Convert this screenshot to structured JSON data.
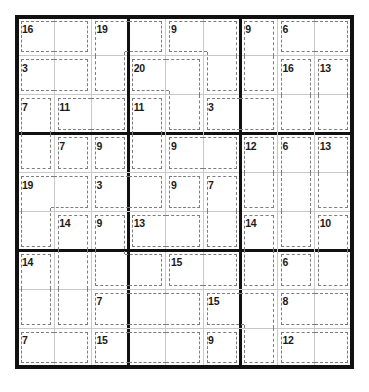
{
  "puzzle": {
    "type": "killer-sudoku",
    "size": 9,
    "cages": [
      {
        "sum": "16",
        "cells": [
          [
            0,
            0
          ],
          [
            0,
            1
          ]
        ]
      },
      {
        "sum": "19",
        "cells": [
          [
            0,
            2
          ],
          [
            0,
            3
          ],
          [
            1,
            2
          ]
        ]
      },
      {
        "sum": "9",
        "cells": [
          [
            0,
            4
          ],
          [
            0,
            5
          ],
          [
            1,
            5
          ]
        ]
      },
      {
        "sum": "9",
        "cells": [
          [
            0,
            6
          ],
          [
            1,
            6
          ]
        ]
      },
      {
        "sum": "6",
        "cells": [
          [
            0,
            7
          ],
          [
            0,
            8
          ]
        ]
      },
      {
        "sum": "3",
        "cells": [
          [
            1,
            0
          ],
          [
            1,
            1
          ]
        ]
      },
      {
        "sum": "20",
        "cells": [
          [
            1,
            3
          ],
          [
            1,
            4
          ],
          [
            2,
            4
          ]
        ]
      },
      {
        "sum": "16",
        "cells": [
          [
            1,
            7
          ],
          [
            2,
            7
          ]
        ]
      },
      {
        "sum": "13",
        "cells": [
          [
            1,
            8
          ],
          [
            2,
            8
          ]
        ]
      },
      {
        "sum": "7",
        "cells": [
          [
            2,
            0
          ],
          [
            3,
            0
          ]
        ]
      },
      {
        "sum": "11",
        "cells": [
          [
            2,
            1
          ],
          [
            2,
            2
          ]
        ]
      },
      {
        "sum": "11",
        "cells": [
          [
            2,
            3
          ],
          [
            3,
            3
          ]
        ]
      },
      {
        "sum": "3",
        "cells": [
          [
            2,
            5
          ],
          [
            2,
            6
          ]
        ]
      },
      {
        "sum": "7",
        "cells": [
          [
            3,
            1
          ]
        ]
      },
      {
        "sum": "9",
        "cells": [
          [
            3,
            2
          ]
        ]
      },
      {
        "sum": "9",
        "cells": [
          [
            3,
            4
          ],
          [
            3,
            5
          ]
        ]
      },
      {
        "sum": "12",
        "cells": [
          [
            3,
            6
          ],
          [
            4,
            6
          ]
        ]
      },
      {
        "sum": "6",
        "cells": [
          [
            3,
            7
          ],
          [
            4,
            7
          ],
          [
            5,
            7
          ]
        ]
      },
      {
        "sum": "13",
        "cells": [
          [
            3,
            8
          ],
          [
            4,
            8
          ]
        ]
      },
      {
        "sum": "19",
        "cells": [
          [
            4,
            0
          ],
          [
            4,
            1
          ],
          [
            5,
            0
          ]
        ]
      },
      {
        "sum": "3",
        "cells": [
          [
            4,
            2
          ],
          [
            4,
            3
          ]
        ]
      },
      {
        "sum": "9",
        "cells": [
          [
            4,
            4
          ]
        ]
      },
      {
        "sum": "7",
        "cells": [
          [
            4,
            5
          ],
          [
            5,
            5
          ]
        ]
      },
      {
        "sum": "14",
        "cells": [
          [
            5,
            1
          ],
          [
            6,
            1
          ],
          [
            7,
            1
          ]
        ]
      },
      {
        "sum": "9",
        "cells": [
          [
            5,
            2
          ],
          [
            6,
            2
          ],
          [
            6,
            3
          ]
        ]
      },
      {
        "sum": "13",
        "cells": [
          [
            5,
            3
          ],
          [
            5,
            4
          ]
        ]
      },
      {
        "sum": "14",
        "cells": [
          [
            5,
            6
          ],
          [
            6,
            6
          ]
        ]
      },
      {
        "sum": "10",
        "cells": [
          [
            5,
            8
          ],
          [
            6,
            8
          ]
        ]
      },
      {
        "sum": "14",
        "cells": [
          [
            6,
            0
          ],
          [
            7,
            0
          ]
        ]
      },
      {
        "sum": "15",
        "cells": [
          [
            6,
            4
          ],
          [
            6,
            5
          ]
        ]
      },
      {
        "sum": "6",
        "cells": [
          [
            6,
            7
          ]
        ]
      },
      {
        "sum": "7",
        "cells": [
          [
            7,
            2
          ],
          [
            7,
            3
          ],
          [
            7,
            4
          ]
        ]
      },
      {
        "sum": "15",
        "cells": [
          [
            7,
            5
          ],
          [
            7,
            6
          ],
          [
            8,
            6
          ]
        ]
      },
      {
        "sum": "8",
        "cells": [
          [
            7,
            7
          ],
          [
            7,
            8
          ]
        ]
      },
      {
        "sum": "7",
        "cells": [
          [
            8,
            0
          ],
          [
            8,
            1
          ]
        ]
      },
      {
        "sum": "15",
        "cells": [
          [
            8,
            2
          ],
          [
            8,
            3
          ],
          [
            8,
            4
          ]
        ]
      },
      {
        "sum": "9",
        "cells": [
          [
            8,
            5
          ]
        ]
      },
      {
        "sum": "12",
        "cells": [
          [
            8,
            7
          ],
          [
            8,
            8
          ]
        ]
      }
    ]
  }
}
